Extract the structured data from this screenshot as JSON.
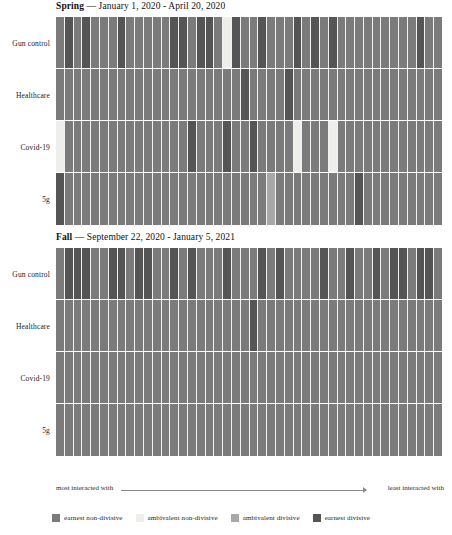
{
  "colors": {
    "earnest_non_divisive": "#7b7b7b",
    "ambivalent_non_divisive": "#eeeeea",
    "ambivalent_divisive": "#a8a8a8",
    "earnest_divisive": "#555555",
    "gridline": "#f2f2f2",
    "background": "#ffffff"
  },
  "axis_note": {
    "most_label": "most interacted with",
    "least_label": "least interacted with"
  },
  "legend": {
    "items": [
      {
        "label": "earnest non-divisive",
        "color": "#7b7b7b"
      },
      {
        "label": "ambivalent non-divisive",
        "color": "#eeeeea"
      },
      {
        "label": "ambivalent divisive",
        "color": "#a8a8a8"
      },
      {
        "label": "earnest divisive",
        "color": "#555555"
      }
    ]
  },
  "chart_data": {
    "type": "heatmap",
    "xlabel": "most interacted with → least interacted with",
    "ylabel": "",
    "grid": true,
    "legend_position": "bottom",
    "columns": 44,
    "category_colors": {
      "earnest non-divisive": "#7b7b7b",
      "ambivalent non-divisive": "#eeeeea",
      "ambivalent divisive": "#a8a8a8",
      "earnest divisive": "#555555"
    },
    "panels": [
      {
        "id": "spring",
        "season": "Spring",
        "range": "— January 1, 2020 - April 20, 2020",
        "title": "Spring — January 1, 2020 - April 20, 2020",
        "rows": [
          {
            "label": "Gun control",
            "values": [
              "earnest non-divisive",
              "earnest divisive",
              "earnest non-divisive",
              "earnest divisive",
              "earnest non-divisive",
              "earnest non-divisive",
              "earnest non-divisive",
              "earnest divisive",
              "earnest non-divisive",
              "earnest non-divisive",
              "earnest non-divisive",
              "earnest non-divisive",
              "earnest non-divisive",
              "earnest divisive",
              "earnest divisive",
              "earnest non-divisive",
              "earnest divisive",
              "earnest divisive",
              "earnest non-divisive",
              "ambivalent non-divisive",
              "earnest divisive",
              "earnest non-divisive",
              "earnest non-divisive",
              "earnest divisive",
              "earnest non-divisive",
              "earnest non-divisive",
              "earnest non-divisive",
              "earnest divisive",
              "earnest non-divisive",
              "earnest divisive",
              "earnest non-divisive",
              "earnest divisive",
              "earnest non-divisive",
              "earnest non-divisive",
              "earnest non-divisive",
              "earnest non-divisive",
              "earnest non-divisive",
              "earnest non-divisive",
              "earnest non-divisive",
              "earnest non-divisive",
              "earnest non-divisive",
              "earnest divisive",
              "earnest non-divisive",
              "earnest non-divisive"
            ]
          },
          {
            "label": "Healthcare",
            "values": [
              "earnest non-divisive",
              "earnest non-divisive",
              "earnest non-divisive",
              "earnest non-divisive",
              "earnest non-divisive",
              "earnest non-divisive",
              "earnest non-divisive",
              "earnest non-divisive",
              "earnest non-divisive",
              "earnest non-divisive",
              "earnest non-divisive",
              "earnest non-divisive",
              "earnest non-divisive",
              "earnest non-divisive",
              "earnest non-divisive",
              "earnest non-divisive",
              "earnest non-divisive",
              "earnest non-divisive",
              "earnest non-divisive",
              "earnest non-divisive",
              "earnest non-divisive",
              "earnest divisive",
              "earnest non-divisive",
              "earnest non-divisive",
              "earnest non-divisive",
              "earnest non-divisive",
              "earnest divisive",
              "earnest non-divisive",
              "earnest non-divisive",
              "earnest non-divisive",
              "earnest non-divisive",
              "earnest non-divisive",
              "earnest non-divisive",
              "earnest non-divisive",
              "earnest non-divisive",
              "earnest non-divisive",
              "earnest non-divisive",
              "earnest non-divisive",
              "earnest non-divisive",
              "earnest non-divisive",
              "earnest non-divisive",
              "earnest non-divisive",
              "earnest non-divisive",
              "earnest non-divisive"
            ]
          },
          {
            "label": "Covid-19",
            "values": [
              "ambivalent non-divisive",
              "earnest non-divisive",
              "earnest non-divisive",
              "earnest non-divisive",
              "earnest non-divisive",
              "earnest non-divisive",
              "earnest non-divisive",
              "earnest non-divisive",
              "earnest non-divisive",
              "earnest non-divisive",
              "earnest non-divisive",
              "earnest non-divisive",
              "earnest non-divisive",
              "earnest non-divisive",
              "earnest non-divisive",
              "earnest divisive",
              "earnest non-divisive",
              "earnest non-divisive",
              "earnest non-divisive",
              "earnest divisive",
              "earnest non-divisive",
              "earnest non-divisive",
              "earnest divisive",
              "earnest non-divisive",
              "earnest non-divisive",
              "earnest non-divisive",
              "earnest non-divisive",
              "ambivalent non-divisive",
              "earnest non-divisive",
              "earnest non-divisive",
              "earnest non-divisive",
              "ambivalent non-divisive",
              "earnest non-divisive",
              "earnest non-divisive",
              "earnest non-divisive",
              "earnest non-divisive",
              "earnest non-divisive",
              "earnest non-divisive",
              "earnest non-divisive",
              "earnest non-divisive",
              "earnest non-divisive",
              "earnest non-divisive",
              "earnest non-divisive",
              "earnest non-divisive"
            ]
          },
          {
            "label": "5g",
            "values": [
              "earnest divisive",
              "earnest non-divisive",
              "earnest non-divisive",
              "earnest non-divisive",
              "earnest non-divisive",
              "earnest non-divisive",
              "earnest non-divisive",
              "earnest non-divisive",
              "earnest non-divisive",
              "earnest non-divisive",
              "earnest non-divisive",
              "earnest non-divisive",
              "earnest non-divisive",
              "earnest non-divisive",
              "earnest non-divisive",
              "earnest non-divisive",
              "earnest non-divisive",
              "earnest non-divisive",
              "earnest non-divisive",
              "earnest non-divisive",
              "earnest non-divisive",
              "earnest non-divisive",
              "earnest non-divisive",
              "earnest non-divisive",
              "ambivalent divisive",
              "earnest non-divisive",
              "earnest non-divisive",
              "earnest non-divisive",
              "earnest non-divisive",
              "earnest non-divisive",
              "earnest non-divisive",
              "earnest non-divisive",
              "earnest non-divisive",
              "earnest non-divisive",
              "earnest divisive",
              "earnest non-divisive",
              "earnest non-divisive",
              "earnest non-divisive",
              "earnest non-divisive",
              "earnest non-divisive",
              "earnest non-divisive",
              "earnest non-divisive",
              "earnest non-divisive",
              "earnest non-divisive"
            ]
          }
        ]
      },
      {
        "id": "fall",
        "season": "Fall",
        "range": "— September 22, 2020 - January 5, 2021",
        "title": "Fall — September 22, 2020 - January 5, 2021",
        "rows": [
          {
            "label": "Gun control",
            "values": [
              "earnest non-divisive",
              "earnest divisive",
              "earnest divisive",
              "earnest divisive",
              "earnest non-divisive",
              "earnest non-divisive",
              "earnest divisive",
              "earnest divisive",
              "earnest non-divisive",
              "earnest divisive",
              "earnest divisive",
              "earnest non-divisive",
              "earnest non-divisive",
              "earnest divisive",
              "earnest non-divisive",
              "earnest divisive",
              "earnest non-divisive",
              "earnest non-divisive",
              "earnest non-divisive",
              "earnest divisive",
              "earnest non-divisive",
              "earnest non-divisive",
              "earnest non-divisive",
              "earnest divisive",
              "earnest non-divisive",
              "earnest divisive",
              "earnest non-divisive",
              "earnest non-divisive",
              "earnest non-divisive",
              "earnest non-divisive",
              "earnest divisive",
              "earnest non-divisive",
              "earnest non-divisive",
              "earnest divisive",
              "earnest non-divisive",
              "earnest non-divisive",
              "earnest divisive",
              "earnest non-divisive",
              "earnest divisive",
              "earnest divisive",
              "earnest non-divisive",
              "earnest divisive",
              "earnest divisive",
              "earnest non-divisive"
            ]
          },
          {
            "label": "Healthcare",
            "values": [
              "earnest non-divisive",
              "earnest non-divisive",
              "earnest non-divisive",
              "earnest non-divisive",
              "earnest non-divisive",
              "earnest non-divisive",
              "earnest non-divisive",
              "earnest non-divisive",
              "earnest non-divisive",
              "earnest non-divisive",
              "earnest non-divisive",
              "earnest non-divisive",
              "earnest non-divisive",
              "earnest non-divisive",
              "earnest non-divisive",
              "earnest non-divisive",
              "earnest non-divisive",
              "earnest non-divisive",
              "earnest non-divisive",
              "earnest non-divisive",
              "earnest non-divisive",
              "earnest non-divisive",
              "earnest divisive",
              "earnest non-divisive",
              "earnest non-divisive",
              "earnest non-divisive",
              "earnest non-divisive",
              "earnest non-divisive",
              "earnest non-divisive",
              "earnest non-divisive",
              "earnest non-divisive",
              "earnest non-divisive",
              "earnest non-divisive",
              "earnest non-divisive",
              "earnest non-divisive",
              "earnest non-divisive",
              "earnest non-divisive",
              "earnest non-divisive",
              "earnest non-divisive",
              "earnest non-divisive",
              "earnest non-divisive",
              "earnest non-divisive",
              "earnest non-divisive",
              "earnest non-divisive"
            ]
          },
          {
            "label": "Covid-19",
            "values": [
              "earnest non-divisive",
              "earnest non-divisive",
              "earnest non-divisive",
              "earnest non-divisive",
              "earnest non-divisive",
              "earnest non-divisive",
              "earnest non-divisive",
              "earnest non-divisive",
              "earnest non-divisive",
              "earnest non-divisive",
              "earnest non-divisive",
              "earnest non-divisive",
              "earnest non-divisive",
              "earnest non-divisive",
              "earnest non-divisive",
              "earnest non-divisive",
              "earnest non-divisive",
              "earnest non-divisive",
              "earnest non-divisive",
              "earnest non-divisive",
              "earnest non-divisive",
              "earnest non-divisive",
              "earnest non-divisive",
              "earnest non-divisive",
              "earnest non-divisive",
              "earnest non-divisive",
              "earnest non-divisive",
              "earnest non-divisive",
              "earnest non-divisive",
              "earnest non-divisive",
              "earnest non-divisive",
              "earnest non-divisive",
              "earnest non-divisive",
              "earnest non-divisive",
              "earnest non-divisive",
              "earnest non-divisive",
              "earnest non-divisive",
              "earnest non-divisive",
              "earnest non-divisive",
              "earnest non-divisive",
              "earnest non-divisive",
              "earnest non-divisive",
              "earnest non-divisive",
              "earnest non-divisive"
            ]
          },
          {
            "label": "5g",
            "values": [
              "earnest non-divisive",
              "earnest non-divisive",
              "earnest non-divisive",
              "earnest non-divisive",
              "earnest non-divisive",
              "earnest non-divisive",
              "earnest non-divisive",
              "earnest non-divisive",
              "earnest non-divisive",
              "earnest non-divisive",
              "earnest non-divisive",
              "earnest non-divisive",
              "earnest non-divisive",
              "earnest non-divisive",
              "earnest non-divisive",
              "earnest non-divisive",
              "earnest non-divisive",
              "earnest non-divisive",
              "earnest non-divisive",
              "earnest non-divisive",
              "earnest non-divisive",
              "earnest non-divisive",
              "earnest non-divisive",
              "earnest non-divisive",
              "earnest non-divisive",
              "earnest non-divisive",
              "earnest non-divisive",
              "earnest non-divisive",
              "earnest non-divisive",
              "earnest non-divisive",
              "earnest non-divisive",
              "earnest non-divisive",
              "earnest non-divisive",
              "earnest non-divisive",
              "earnest non-divisive",
              "earnest non-divisive",
              "earnest non-divisive",
              "earnest non-divisive",
              "earnest non-divisive",
              "earnest non-divisive",
              "earnest non-divisive",
              "earnest non-divisive",
              "earnest non-divisive",
              "earnest non-divisive"
            ]
          }
        ]
      }
    ]
  }
}
